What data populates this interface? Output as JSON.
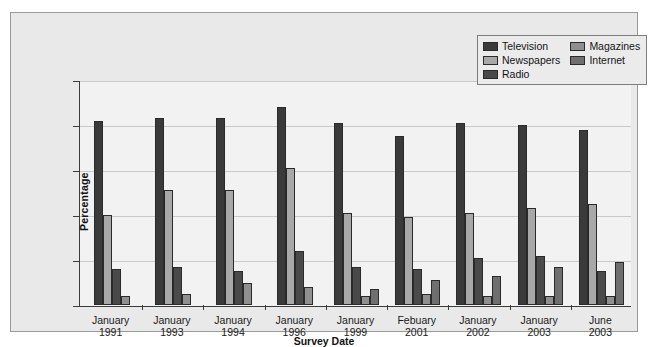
{
  "chart_data": {
    "type": "bar",
    "title": "",
    "xlabel": "Survey Date",
    "ylabel": "Percentage",
    "ylim": [
      0,
      100
    ],
    "yticks": [
      "0",
      "20",
      "40",
      "60",
      "80",
      "100"
    ],
    "grid": true,
    "legend_position": "top-right",
    "categories": [
      "January\n1991",
      "January\n1993",
      "January\n1994",
      "January\n1996",
      "January\n1999",
      "Febuary\n2001",
      "January\n2002",
      "January\n2003",
      "June\n2003"
    ],
    "category_lines": [
      [
        "January",
        "1991"
      ],
      [
        "January",
        "1993"
      ],
      [
        "January",
        "1994"
      ],
      [
        "January",
        "1996"
      ],
      [
        "January",
        "1999"
      ],
      [
        "Febuary",
        "2001"
      ],
      [
        "January",
        "2002"
      ],
      [
        "January",
        "2003"
      ],
      [
        "June",
        "2003"
      ]
    ],
    "series": [
      {
        "name": "Television",
        "color": "#3a3a3a",
        "values": [
          82,
          83,
          83,
          88,
          81,
          75,
          81,
          80,
          78
        ]
      },
      {
        "name": "Newspapers",
        "color": "#a8a8a8",
        "values": [
          40,
          51,
          51,
          61,
          41,
          39,
          41,
          43,
          45
        ]
      },
      {
        "name": "Radio",
        "color": "#4a4a4a",
        "values": [
          16,
          17,
          15,
          24,
          17,
          16,
          21,
          22,
          15
        ]
      },
      {
        "name": "Magazines",
        "color": "#8f8f8f",
        "values": [
          4,
          5,
          10,
          8,
          4,
          5,
          4,
          4,
          4
        ]
      },
      {
        "name": "Internet",
        "color": "#6f6f6f",
        "values": [
          null,
          null,
          null,
          null,
          7,
          11,
          13,
          17,
          19
        ]
      }
    ]
  },
  "legend": {
    "entries": [
      {
        "label": "Television",
        "color": "#3a3a3a"
      },
      {
        "label": "Magazines",
        "color": "#8f8f8f"
      },
      {
        "label": "Newspapers",
        "color": "#a8a8a8"
      },
      {
        "label": "Internet",
        "color": "#6f6f6f"
      },
      {
        "label": "Radio",
        "color": "#4a4a4a"
      }
    ]
  }
}
